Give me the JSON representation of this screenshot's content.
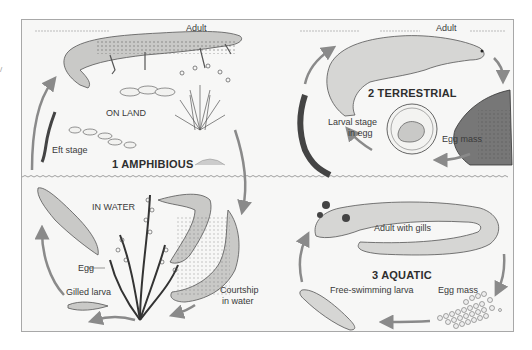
{
  "diagram": {
    "type": "life-cycle diagram",
    "panels": [
      {
        "id": "amphibious",
        "title": "1 AMPHIBIOUS",
        "habitats": [
          "ON LAND",
          "IN WATER"
        ],
        "labels": {
          "adult": "Adult",
          "on_land": "ON LAND",
          "eft_stage": "Eft stage",
          "in_water": "IN WATER",
          "egg": "Egg",
          "gilled_larva": "Gilled larva",
          "courtship_line1": "Courtship",
          "courtship_line2": "in water"
        }
      },
      {
        "id": "terrestrial",
        "title": "2 TERRESTRIAL",
        "labels": {
          "adult": "Adult",
          "larval_line1": "Larval stage",
          "larval_line2": "in egg",
          "egg_mass": "Egg mass"
        }
      },
      {
        "id": "aquatic",
        "title": "3 AQUATIC",
        "labels": {
          "adult_with_gills": "Adult with gills",
          "free_swimming_larva": "Free-swimming larva",
          "egg_mass": "Egg mass"
        }
      }
    ],
    "colors": {
      "frame_border": "#a8a8a8",
      "background": "#f7f7f6",
      "arrow": "#8a8a8a",
      "animal_fill": "#c9c9c7",
      "animal_stroke": "#555555",
      "text": "#3a3a3a"
    }
  }
}
